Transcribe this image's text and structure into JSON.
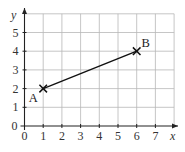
{
  "chart_data": {
    "type": "line",
    "title": "",
    "xlabel": "x",
    "ylabel": "y",
    "xlim": [
      0,
      8
    ],
    "ylim": [
      0,
      6
    ],
    "grid": true,
    "x_ticks": [
      "0",
      "1",
      "2",
      "3",
      "4",
      "5",
      "6",
      "7"
    ],
    "y_ticks": [
      "0",
      "1",
      "2",
      "3",
      "4",
      "5"
    ],
    "points": [
      {
        "label": "A",
        "x": 1,
        "y": 2
      },
      {
        "label": "B",
        "x": 6,
        "y": 4
      }
    ],
    "segments": [
      {
        "from": "A",
        "to": "B"
      }
    ],
    "colors": {
      "grid": "#b8b8b8",
      "axis": "#222222",
      "line": "#111111"
    }
  }
}
